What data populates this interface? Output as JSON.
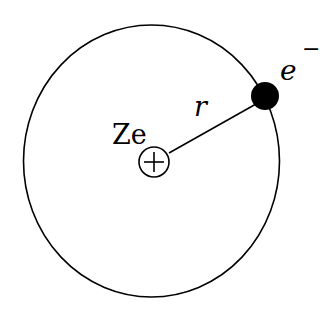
{
  "diagram": {
    "labels": {
      "nucleus_charge": "Ze",
      "radius": "r",
      "electron": "e",
      "electron_superscript": "−"
    },
    "nucleus_symbol": "plus-in-circle",
    "colors": {
      "stroke": "#000000",
      "background": "#ffffff",
      "electron_fill": "#000000"
    }
  }
}
